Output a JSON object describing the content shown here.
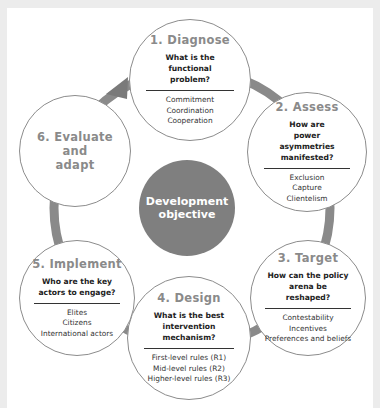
{
  "diagram": {
    "center": {
      "line1": "Development",
      "line2": "objective",
      "color": "#7f7f7f"
    },
    "ring_color": "#8a8a8a",
    "steps": [
      {
        "title": "1. Diagnose",
        "question": "What is the functional problem?",
        "items": [
          "Commitment",
          "Coordination",
          "Cooperation"
        ]
      },
      {
        "title": "2. Assess",
        "question": "How are power asymmetries manifested?",
        "items": [
          "Exclusion",
          "Capture",
          "Clientelism"
        ]
      },
      {
        "title": "3. Target",
        "question": "How can the policy arena be reshaped?",
        "items": [
          "Contestability",
          "Incentives",
          "Preferences and beliefs"
        ]
      },
      {
        "title": "4. Design",
        "question": "What is the best intervention mechanism?",
        "items": [
          "First-level rules (R1)",
          "Mid-level rules (R2)",
          "Higher-level rules (R3)"
        ]
      },
      {
        "title": "5. Implement",
        "question": "Who are the key actors to engage?",
        "items": [
          "Elites",
          "Citizens",
          "International actors"
        ]
      },
      {
        "title_lines": [
          "6. Evaluate",
          "and",
          "adapt"
        ]
      }
    ]
  }
}
